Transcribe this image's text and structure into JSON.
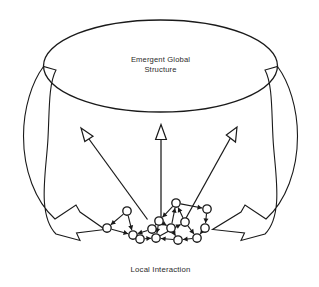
{
  "diagram": {
    "type": "emergence-feedback-loop",
    "colors": {
      "stroke": "#1a1a1a",
      "fill": "#ffffff",
      "text": "#2b2b2b",
      "background": "#ffffff"
    },
    "top_label": {
      "line1": "Emergent Global",
      "line2": "Structure"
    },
    "bottom_label": "Local Interaction",
    "upward_arrows": {
      "count": 3,
      "semantics": "local-to-global emergence",
      "arrows": [
        {
          "name": "left-upward-arrow",
          "x1": 147,
          "y1": 219,
          "x2": 82,
          "y2": 130
        },
        {
          "name": "center-upward-arrow",
          "x1": 161,
          "y1": 222,
          "x2": 161,
          "y2": 128
        },
        {
          "name": "right-upward-arrow",
          "x1": 185,
          "y1": 219,
          "x2": 236,
          "y2": 130
        }
      ]
    },
    "downward_bands": {
      "count": 2,
      "semantics": "global-to-local constraint",
      "bands": [
        {
          "name": "left-feedback-band"
        },
        {
          "name": "right-feedback-band"
        }
      ]
    },
    "network": {
      "node_count": 14,
      "node_radius": 4.2,
      "nodes": [
        {
          "id": 0,
          "x": 127,
          "y": 211
        },
        {
          "id": 1,
          "x": 107,
          "y": 228
        },
        {
          "id": 2,
          "x": 133,
          "y": 235
        },
        {
          "id": 3,
          "x": 152,
          "y": 229
        },
        {
          "id": 4,
          "x": 159,
          "y": 221
        },
        {
          "id": 5,
          "x": 176,
          "y": 203
        },
        {
          "id": 6,
          "x": 185,
          "y": 222
        },
        {
          "id": 7,
          "x": 207,
          "y": 209
        },
        {
          "id": 8,
          "x": 205,
          "y": 228
        },
        {
          "id": 9,
          "x": 197,
          "y": 238
        },
        {
          "id": 10,
          "x": 178,
          "y": 240
        },
        {
          "id": 11,
          "x": 156,
          "y": 238
        },
        {
          "id": 12,
          "x": 140,
          "y": 239
        },
        {
          "id": 13,
          "x": 171,
          "y": 228
        }
      ],
      "edges": [
        {
          "from": 0,
          "to": 1
        },
        {
          "from": 0,
          "to": 2
        },
        {
          "from": 1,
          "to": 2
        },
        {
          "from": 2,
          "to": 12
        },
        {
          "from": 12,
          "to": 11
        },
        {
          "from": 3,
          "to": 2
        },
        {
          "from": 4,
          "to": 3
        },
        {
          "from": 5,
          "to": 4
        },
        {
          "from": 5,
          "to": 7
        },
        {
          "from": 4,
          "to": 13
        },
        {
          "from": 13,
          "to": 5
        },
        {
          "from": 6,
          "to": 5
        },
        {
          "from": 7,
          "to": 8
        },
        {
          "from": 8,
          "to": 9
        },
        {
          "from": 9,
          "to": 10
        },
        {
          "from": 10,
          "to": 11
        },
        {
          "from": 11,
          "to": 6
        },
        {
          "from": 6,
          "to": 9
        },
        {
          "from": 4,
          "to": 11
        },
        {
          "from": 13,
          "to": 10
        }
      ]
    },
    "ellipse": {
      "cx": 160.5,
      "cy": 66,
      "rx": 117,
      "ry": 46
    }
  }
}
